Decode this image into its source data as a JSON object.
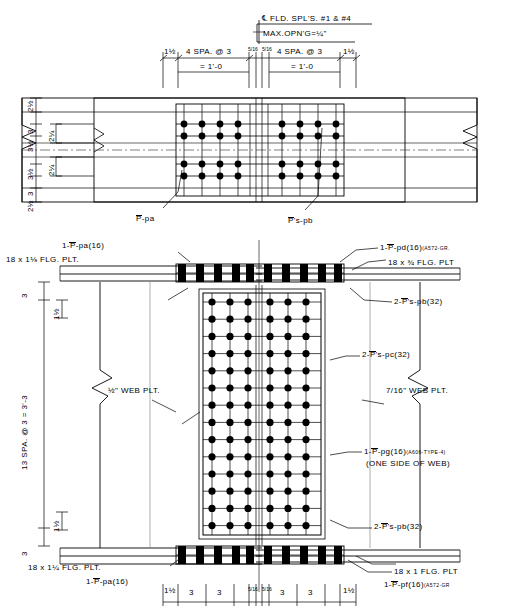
{
  "drawing": {
    "title": "GIRDER FIELD SPLICE DETAIL",
    "type": "engineering-drawing"
  },
  "top_view": {
    "centerline_note": "FLD. SPL'S. #1 & #4",
    "centerline_symbol": "℄",
    "max_opening": "MAX.OPN'G=",
    "max_opening_value": "¼\"",
    "dim_left_end": "1½",
    "dim_right_end": "1½",
    "spa_left": "4 SPA. @ 3",
    "spa_left_total": "= 1'-0",
    "spa_right": "4 SPA. @ 3",
    "spa_right_total": "= 1'-0",
    "gap_left": "5/16",
    "gap_right": "5/16",
    "left_dims": [
      "2½",
      "3",
      "3½",
      "3½",
      "3",
      "2½"
    ],
    "inner_dims": [
      "2¼",
      "2¼"
    ],
    "label_pa": "-pa",
    "label_pb": "'s-pb",
    "bolt_cols": 10,
    "bolt_rows": 4
  },
  "elevation": {
    "label_top_left_plate": "1-",
    "label_top_left_plate_rest": "-pa(16)",
    "label_top_left_flange": "18 x 1⅛ FLG. PLT.",
    "label_top_right_plate": "1-",
    "label_top_right_plate_rest": "-pd(16)",
    "label_top_right_spec": "(A572-GR.",
    "label_top_right_flange": "18 x ¾ FLG. PLT",
    "label_pb_top": "2-",
    "label_pb_top_rest": "'s-pb(32)",
    "label_pc": "2-",
    "label_pc_rest": "'s-pc(32)",
    "label_pb_bottom": "2-",
    "label_pb_bottom_rest": "'s-pb(32)",
    "label_web_left": "½\" WEB PLT.",
    "label_web_right_frac": "7/16",
    "label_web_right": "\" WEB PLT.",
    "label_pg": "1-",
    "label_pg_rest": "-pg(16)",
    "label_pg_spec": "(A606-TYPE-4)",
    "label_pg_note": "(ONE SIDE OF WEB)",
    "label_bot_left_flange": "18 x 1¼ FLG. PLT.",
    "label_bot_left_plate": "1-",
    "label_bot_left_plate_rest": "-pa(16)",
    "label_bot_right_flange": "18 x 1 FLG. PLT",
    "label_bot_right_plate": "1-",
    "label_bot_right_plate_rest": "-pf(16)",
    "label_bot_right_spec": "(A572-GR",
    "vert_dim_main": "13 SPA. @ 3 = 3'-3",
    "vert_dim_top": "3",
    "vert_dim_bottom": "3",
    "vert_edge_top": "1½",
    "vert_edge_bottom": "1½",
    "web_bolt_cols": 6,
    "web_bolt_rows": 14
  },
  "bottom_dims": {
    "items": [
      "1½",
      "3",
      "3",
      "5/16",
      "5/16",
      "3",
      "3",
      "1½"
    ]
  },
  "plate_symbol": "P",
  "colors": {
    "line": "#000000",
    "bolt": "#000000",
    "paper": "#ffffff",
    "light": "#6d6d6d"
  }
}
